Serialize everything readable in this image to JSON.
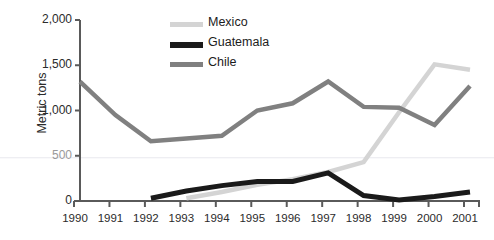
{
  "chart_data": {
    "type": "line",
    "title": "",
    "xlabel": "",
    "ylabel": "Metric tons",
    "x": [
      1990,
      1991,
      1992,
      1993,
      1994,
      1995,
      1996,
      1997,
      1998,
      1999,
      2000,
      2001
    ],
    "categories": [
      "1990",
      "1991",
      "1992",
      "1993",
      "1994",
      "1995",
      "1996",
      "1997",
      "1998",
      "1999",
      "2000",
      "2001"
    ],
    "ylim": [
      0,
      2000
    ],
    "yticks": [
      0,
      500,
      1000,
      1500,
      2000
    ],
    "ytick_labels": [
      "0",
      "500",
      "1,000",
      "1,500",
      "2,000"
    ],
    "grid": false,
    "legend_position": "top-center",
    "series": [
      {
        "name": "Mexico",
        "color": "#d4d4d4",
        "values": [
          null,
          null,
          null,
          30,
          100,
          180,
          240,
          320,
          430,
          980,
          1510,
          1450
        ]
      },
      {
        "name": "Guatemala",
        "color": "#1a1a1a",
        "values": [
          null,
          null,
          30,
          110,
          170,
          215,
          215,
          310,
          60,
          10,
          50,
          100
        ]
      },
      {
        "name": "Chile",
        "color": "#808080",
        "values": [
          1320,
          950,
          660,
          690,
          720,
          1000,
          1080,
          1320,
          1040,
          1030,
          840,
          1270
        ]
      }
    ]
  },
  "legend": {
    "items": [
      {
        "label": "Mexico",
        "color": "#d4d4d4"
      },
      {
        "label": "Guatemala",
        "color": "#1a1a1a"
      },
      {
        "label": "Chile",
        "color": "#808080"
      }
    ]
  },
  "axes": {
    "y_title": "Metric tons",
    "y_labels": [
      "2,000",
      "1,500",
      "1,000",
      "500",
      "0"
    ],
    "x_labels": [
      "1990",
      "1991",
      "1992",
      "1993",
      "1994",
      "1995",
      "1996",
      "1997",
      "1998",
      "1999",
      "2000",
      "2001"
    ]
  },
  "colors": {
    "axis": "#5a5a5a",
    "text": "#2b2b2b",
    "background": "#ffffff",
    "faint_gridline": "#e8e8ee"
  }
}
